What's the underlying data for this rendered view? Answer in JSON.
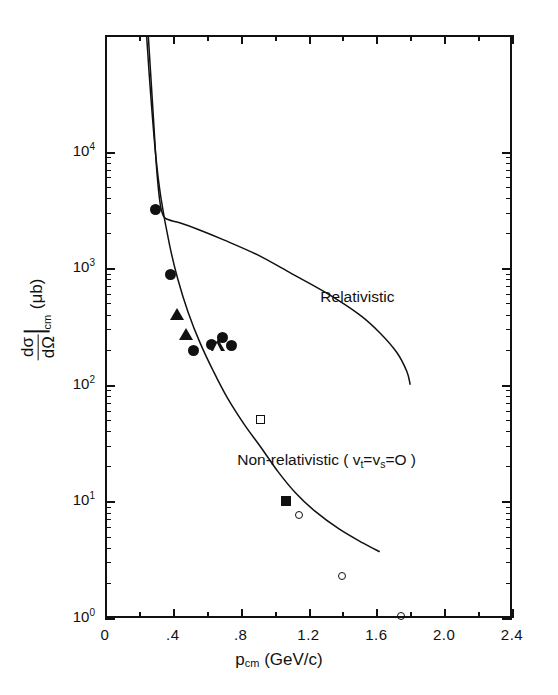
{
  "chart_data": {
    "type": "scatter",
    "title": "",
    "xlabel": "p_cm (GeV/c)",
    "ylabel": "dσ/dΩ|_cm (μb)",
    "xlim": [
      0,
      2.4
    ],
    "ylim": [
      1,
      100000
    ],
    "yscale": "log",
    "xscale": "linear",
    "grid": false,
    "legend": "none (curves labelled inline)",
    "x_ticks": [
      "0",
      ".4",
      ".8",
      "1.2",
      "1.6",
      "2.0",
      "2.4"
    ],
    "x_tick_values": [
      0,
      0.4,
      0.8,
      1.2,
      1.6,
      2.0,
      2.4
    ],
    "x_minor_tick_values": [
      0.2,
      0.6,
      1.0,
      1.4,
      1.8,
      2.2
    ],
    "y_ticks": [
      "10",
      "10",
      "10",
      "10",
      "10"
    ],
    "y_tick_exponents": [
      "4",
      "3",
      "2",
      "1",
      "0"
    ],
    "y_tick_values": [
      10000,
      1000,
      100,
      10,
      1
    ],
    "series": [
      {
        "name": "Relativistic",
        "type": "line",
        "label": "Relativistic",
        "label_x": 1.27,
        "label_y": 560,
        "points": [
          [
            0.255,
            100000
          ],
          [
            0.285,
            20000
          ],
          [
            0.305,
            7000
          ],
          [
            0.325,
            3600
          ],
          [
            0.345,
            2800
          ],
          [
            0.375,
            2600
          ],
          [
            0.44,
            2450
          ],
          [
            0.55,
            2150
          ],
          [
            0.7,
            1750
          ],
          [
            0.9,
            1300
          ],
          [
            1.1,
            900
          ],
          [
            1.3,
            620
          ],
          [
            1.5,
            400
          ],
          [
            1.62,
            280
          ],
          [
            1.72,
            190
          ],
          [
            1.78,
            130
          ],
          [
            1.8,
            100
          ]
        ]
      },
      {
        "name": "Non-relativistic (v_t=v_s=0)",
        "type": "line",
        "label": "Non-relativistic ( v",
        "label_sub1": "t",
        "label_mid": "=v",
        "label_sub2": "s",
        "label_end": "=O )",
        "label_x": 0.78,
        "label_y": 22,
        "points": [
          [
            0.245,
            100000
          ],
          [
            0.27,
            30000
          ],
          [
            0.3,
            9000
          ],
          [
            0.33,
            4000
          ],
          [
            0.38,
            1600
          ],
          [
            0.43,
            800
          ],
          [
            0.49,
            420
          ],
          [
            0.56,
            230
          ],
          [
            0.64,
            130
          ],
          [
            0.72,
            78
          ],
          [
            0.82,
            46
          ],
          [
            0.92,
            29
          ],
          [
            1.02,
            18
          ],
          [
            1.12,
            12
          ],
          [
            1.24,
            8.2
          ],
          [
            1.38,
            5.8
          ],
          [
            1.52,
            4.4
          ],
          [
            1.62,
            3.7
          ]
        ]
      },
      {
        "name": "filled circles",
        "type": "scatter",
        "marker": "circle-filled",
        "points": [
          [
            0.3,
            3200
          ],
          [
            0.385,
            880
          ],
          [
            0.52,
            196
          ],
          [
            0.63,
            222
          ],
          [
            0.695,
            252
          ],
          [
            0.745,
            218
          ]
        ]
      },
      {
        "name": "filled triangles",
        "type": "scatter",
        "marker": "triangle-filled",
        "points": [
          [
            0.425,
            405
          ],
          [
            0.475,
            272
          ]
        ]
      },
      {
        "name": "open triangle",
        "type": "scatter",
        "marker": "triangle-open",
        "points": [
          [
            0.665,
            218
          ]
        ]
      },
      {
        "name": "open square",
        "type": "scatter",
        "marker": "square-open",
        "points": [
          [
            0.915,
            50
          ]
        ]
      },
      {
        "name": "filled square",
        "type": "scatter",
        "marker": "square-filled",
        "points": [
          [
            1.07,
            10.0
          ]
        ]
      },
      {
        "name": "open circles",
        "type": "scatter",
        "marker": "circle-open",
        "points": [
          [
            1.145,
            7.6
          ],
          [
            1.395,
            2.3
          ],
          [
            1.745,
            1.05
          ]
        ]
      }
    ]
  },
  "axes": {
    "x_title_main": "p",
    "x_title_sub": "cm",
    "x_title_unit": "(GeV/c)",
    "y_title_num": "dσ",
    "y_title_den": "dΩ",
    "y_title_sub": "cm",
    "y_title_unit": "(μb)"
  },
  "annotations": {
    "relativistic": "Relativistic",
    "nonrelativistic_pre": "Non-relativistic ( v",
    "nonrelativistic_sub1": "t",
    "nonrelativistic_mid": "=v",
    "nonrelativistic_sub2": "s",
    "nonrelativistic_post": "=O )"
  }
}
